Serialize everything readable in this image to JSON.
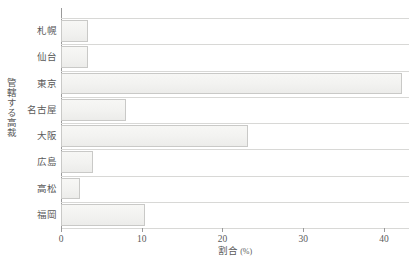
{
  "chart_data": {
    "type": "bar",
    "orientation": "horizontal",
    "title": "",
    "xlabel": "割合",
    "xlabel_unit": "(%)",
    "ylabel": "管轄する高裁",
    "categories": [
      "札幌",
      "仙台",
      "東京",
      "名古屋",
      "大阪",
      "広島",
      "高松",
      "福岡"
    ],
    "values": [
      3.4,
      3.4,
      42.2,
      8.0,
      23.2,
      4.0,
      2.4,
      10.4
    ],
    "xlim": [
      0,
      43.1
    ],
    "ylim": [
      0,
      8
    ],
    "xticks": [
      0,
      10,
      20,
      30,
      40
    ],
    "xtick_labels": [
      "0",
      "10",
      "20",
      "30",
      "40"
    ],
    "grid": "horizontal-rowlines",
    "legend": null,
    "bar_fill": "#f3f3f1",
    "bar_border": "#c9c9c7",
    "axis_color": "#9a9a9a",
    "grid_color": "#d8d8d6",
    "text_color": "#5a5a5a"
  }
}
